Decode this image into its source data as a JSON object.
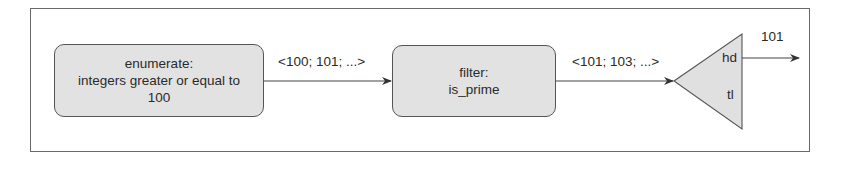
{
  "diagram": {
    "type": "dataflow-pipeline",
    "nodes": [
      {
        "id": "enumerate",
        "shape": "rounded-rect",
        "lines": [
          "enumerate:",
          "integers greater or equal to",
          "100"
        ]
      },
      {
        "id": "filter",
        "shape": "rounded-rect",
        "lines": [
          "filter:",
          "is_prime"
        ]
      },
      {
        "id": "split",
        "shape": "triangle",
        "ports": {
          "head": "hd",
          "tail": "tl"
        }
      }
    ],
    "edges": [
      {
        "from": "enumerate",
        "to": "filter",
        "label": "<100; 101; ...>"
      },
      {
        "from": "filter",
        "to": "split",
        "label": "<101; 103; ...>"
      },
      {
        "from": "split.hd",
        "to": "output",
        "label": "101"
      }
    ],
    "colors": {
      "node_fill": "#e2e2e2",
      "stroke": "#555555",
      "text": "#2a2a2a",
      "frame": "#6a6a6a"
    }
  }
}
